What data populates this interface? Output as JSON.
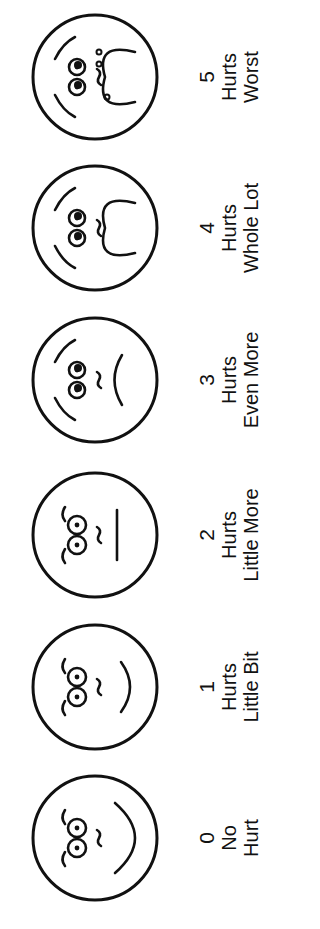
{
  "orientation": "rotated-90-ccw",
  "ink_color": "#111111",
  "background_color": "#ffffff",
  "faces": [
    {
      "rating": "0",
      "line1": "No",
      "line2": "Hurt",
      "expression": "smiling-happy"
    },
    {
      "rating": "1",
      "line1": "Hurts",
      "line2": "Little Bit",
      "expression": "slight-smile"
    },
    {
      "rating": "2",
      "line1": "Hurts",
      "line2": "Little More",
      "expression": "neutral"
    },
    {
      "rating": "3",
      "line1": "Hurts",
      "line2": "Even More",
      "expression": "slight-frown"
    },
    {
      "rating": "4",
      "line1": "Hurts",
      "line2": "Whole Lot",
      "expression": "frown"
    },
    {
      "rating": "5",
      "line1": "Hurts",
      "line2": "Worst",
      "expression": "crying"
    }
  ]
}
